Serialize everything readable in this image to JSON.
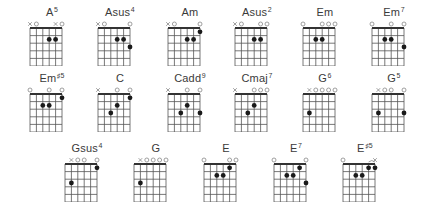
{
  "diagram": {
    "type": "guitar-chord-chart",
    "strings": 6,
    "frets_shown": 5,
    "chords": [
      {
        "name": "A",
        "sup": "5",
        "x": 22,
        "y": 6,
        "markers": [
          "x",
          "o",
          "",
          "",
          "x",
          "o"
        ],
        "dots": [
          [
            3,
            2
          ],
          [
            4,
            2
          ]
        ],
        "barre": null
      },
      {
        "name": "Asus",
        "sup": "4",
        "x": 90,
        "y": 6,
        "markers": [
          "x",
          "o",
          "",
          "",
          "",
          "o"
        ],
        "dots": [
          [
            3,
            2
          ],
          [
            4,
            2
          ],
          [
            5,
            3
          ]
        ],
        "barre": null
      },
      {
        "name": "Am",
        "sup": "",
        "x": 160,
        "y": 6,
        "markers": [
          "x",
          "o",
          "",
          "",
          "",
          "o"
        ],
        "dots": [
          [
            3,
            2
          ],
          [
            4,
            2
          ],
          [
            5,
            1
          ]
        ],
        "barre": null
      },
      {
        "name": "Asus",
        "sup": "2",
        "x": 227,
        "y": 6,
        "markers": [
          "x",
          "o",
          "",
          "",
          "o",
          "o"
        ],
        "dots": [
          [
            3,
            2
          ],
          [
            4,
            2
          ]
        ],
        "barre": null
      },
      {
        "name": "Em",
        "sup": "",
        "x": 295,
        "y": 6,
        "markers": [
          "o",
          "",
          "",
          "o",
          "o",
          "o"
        ],
        "dots": [
          [
            2,
            2
          ],
          [
            3,
            2
          ]
        ],
        "barre": null
      },
      {
        "name": "Em",
        "sup": "7",
        "x": 364,
        "y": 6,
        "markers": [
          "o",
          "",
          "",
          "o",
          "",
          "o"
        ],
        "dots": [
          [
            2,
            2
          ],
          [
            3,
            2
          ],
          [
            5,
            3
          ]
        ],
        "barre": null
      },
      {
        "name": "Em",
        "sup": "♯5",
        "x": 22,
        "y": 72,
        "markers": [
          "o",
          "",
          "",
          "o",
          "",
          "o"
        ],
        "dots": [
          [
            2,
            2
          ],
          [
            3,
            2
          ],
          [
            5,
            1
          ]
        ],
        "barre": null
      },
      {
        "name": "C",
        "sup": "",
        "x": 90,
        "y": 72,
        "markers": [
          "x",
          "",
          "",
          "o",
          "",
          "o"
        ],
        "dots": [
          [
            2,
            3
          ],
          [
            3,
            2
          ],
          [
            5,
            1
          ]
        ],
        "barre": null
      },
      {
        "name": "Cadd",
        "sup": "9",
        "x": 160,
        "y": 72,
        "markers": [
          "x",
          "",
          "",
          "o",
          "",
          "o"
        ],
        "dots": [
          [
            2,
            3
          ],
          [
            3,
            2
          ],
          [
            5,
            3
          ]
        ],
        "barre": null
      },
      {
        "name": "Cmaj",
        "sup": "7",
        "x": 227,
        "y": 72,
        "markers": [
          "x",
          "",
          "",
          "o",
          "o",
          "o"
        ],
        "dots": [
          [
            2,
            3
          ],
          [
            3,
            2
          ]
        ],
        "barre": null
      },
      {
        "name": "G",
        "sup": "6",
        "x": 295,
        "y": 72,
        "markers": [
          "",
          "x",
          "o",
          "o",
          "o",
          "o"
        ],
        "dots": [
          [
            1,
            3
          ]
        ],
        "barre": null
      },
      {
        "name": "G",
        "sup": "5",
        "x": 364,
        "y": 72,
        "markers": [
          "",
          "x",
          "o",
          "o",
          "",
          "o"
        ],
        "dots": [
          [
            1,
            3
          ],
          [
            5,
            3
          ]
        ],
        "barre": null
      },
      {
        "name": "Gsus",
        "sup": "4",
        "x": 57,
        "y": 142,
        "markers": [
          "",
          "x",
          "o",
          "o",
          "",
          "o"
        ],
        "dots": [
          [
            1,
            3
          ],
          [
            5,
            1
          ]
        ],
        "barre": null
      },
      {
        "name": "G",
        "sup": "",
        "x": 126,
        "y": 142,
        "markers": [
          "",
          "x",
          "o",
          "o",
          "o",
          "o"
        ],
        "dots": [
          [
            1,
            3
          ]
        ],
        "barre": null
      },
      {
        "name": "E",
        "sup": "",
        "x": 196,
        "y": 142,
        "markers": [
          "o",
          "",
          "",
          "",
          "o",
          "o"
        ],
        "dots": [
          [
            2,
            2
          ],
          [
            3,
            2
          ],
          [
            4,
            1
          ]
        ],
        "barre": null
      },
      {
        "name": "E",
        "sup": "7",
        "x": 266,
        "y": 142,
        "markers": [
          "o",
          "",
          "",
          "",
          "",
          "o"
        ],
        "dots": [
          [
            2,
            2
          ],
          [
            3,
            2
          ],
          [
            4,
            1
          ],
          [
            5,
            3
          ]
        ],
        "barre": null
      },
      {
        "name": "E",
        "sup": "♯5",
        "x": 335,
        "y": 142,
        "markers": [
          "o",
          "",
          "",
          "",
          "",
          "x"
        ],
        "dots": [
          [
            2,
            2
          ],
          [
            3,
            2
          ],
          [
            4,
            1
          ],
          [
            5,
            1
          ]
        ],
        "barre": [
          4,
          5
        ]
      }
    ]
  },
  "colors": {
    "grid": "#555555",
    "nut": "#333333",
    "dot": "#1a1a1a",
    "marker": "#888888",
    "title": "#3a3a3a"
  }
}
